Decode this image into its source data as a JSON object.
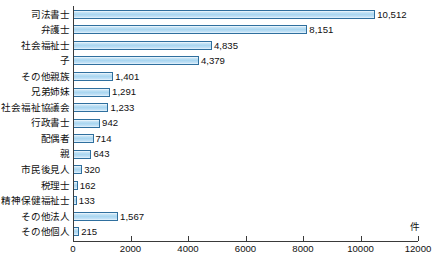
{
  "chart_data": {
    "type": "bar",
    "orientation": "horizontal",
    "title": "",
    "xlabel": "件",
    "ylabel": "",
    "xlim": [
      0,
      12000
    ],
    "grid": false,
    "legend": null,
    "xticks": [
      "0",
      "2000",
      "4000",
      "6000",
      "8000",
      "10000",
      "12000"
    ],
    "xtick_values": [
      0,
      2000,
      4000,
      6000,
      8000,
      10000,
      12000
    ],
    "categories": [
      "司法書士",
      "弁護士",
      "社会福祉士",
      "子",
      "その他親族",
      "兄弟姉妹",
      "社会福祉協議会",
      "行政書士",
      "配偶者",
      "親",
      "市民後見人",
      "税理士",
      "精神保健福祉士",
      "その他法人",
      "その他個人"
    ],
    "values": [
      10512,
      8151,
      4835,
      4379,
      1401,
      1291,
      1233,
      942,
      714,
      643,
      320,
      162,
      133,
      1567,
      215
    ],
    "value_labels": [
      "10,512",
      "8,151",
      "4,835",
      "4,379",
      "1,401",
      "1,291",
      "1,233",
      "942",
      "714",
      "643",
      "320",
      "162",
      "133",
      "1,567",
      "215"
    ],
    "colors": {
      "bar_fill": "#a9d6f0",
      "bar_border": "#2f6f9e",
      "axis": "#3a3a3a",
      "text": "#101010",
      "background": "#ffffff"
    }
  }
}
